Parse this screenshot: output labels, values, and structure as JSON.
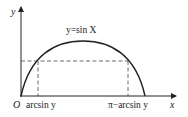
{
  "diagram": {
    "y_axis_label": "y",
    "x_axis_label": "x",
    "origin_label": "O",
    "curve_label": "y=sin X",
    "left_tick_label": "arcsin y",
    "right_tick_label": "π−arcsin y"
  },
  "colors": {
    "stroke": "#222222",
    "dash": "#444444"
  }
}
